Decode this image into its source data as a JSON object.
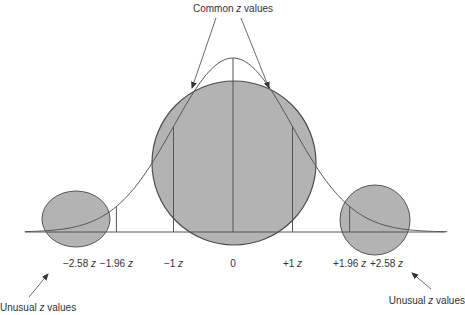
{
  "title": "Common z values",
  "title_parts": {
    "pre": "Common ",
    "var": "z",
    "post": " values"
  },
  "unusual_left": {
    "pre": "Unusual ",
    "var": "z",
    "post": " values"
  },
  "unusual_right": {
    "pre": "Unusual ",
    "var": "z",
    "post": " values"
  },
  "colors": {
    "circle_fill": "#b3b3b3",
    "circle_stroke": "#4d4d4d",
    "line": "#555555",
    "text": "#333333",
    "background": "#ffffff"
  },
  "axis": {
    "ticks": [
      {
        "num": "−2.58",
        "var": "z",
        "value": -2.58
      },
      {
        "num": "−1.96",
        "var": "z",
        "value": -1.96
      },
      {
        "num": "−1",
        "var": "z",
        "value": -1
      },
      {
        "num": "0",
        "var": "",
        "value": 0
      },
      {
        "num": "+1",
        "var": "z",
        "value": 1
      },
      {
        "num": "+1.96",
        "var": "z",
        "value": 1.96
      },
      {
        "num": "+2.58",
        "var": "z",
        "value": 2.58
      }
    ],
    "vertical_lines_at": [
      -1.96,
      -1,
      0,
      1,
      1.96
    ],
    "range": [
      -3.5,
      3.6
    ]
  },
  "regions": [
    {
      "name": "common",
      "description": "Common z values",
      "center_z": 0
    },
    {
      "name": "unusual-left",
      "description": "Unusual z values",
      "center_z": -2.58
    },
    {
      "name": "unusual-right",
      "description": "Unusual z values",
      "center_z": 2.58
    }
  ]
}
